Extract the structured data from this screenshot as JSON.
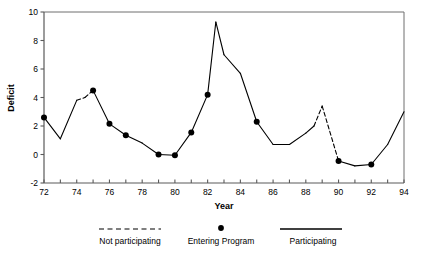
{
  "chart_data": {
    "type": "line",
    "title": "",
    "xlabel": "Year",
    "ylabel": "Deficit",
    "xlim": [
      72,
      94
    ],
    "ylim": [
      -2,
      10
    ],
    "xticks": [
      72,
      73,
      74,
      75,
      76,
      77,
      78,
      79,
      80,
      81,
      82,
      83,
      84,
      85,
      86,
      87,
      88,
      89,
      90,
      91,
      92,
      93,
      94
    ],
    "xtick_labels": [
      "72",
      "",
      "74",
      "",
      "76",
      "",
      "78",
      "",
      "80",
      "",
      "82",
      "",
      "84",
      "",
      "86",
      "",
      "88",
      "",
      "90",
      "",
      "92",
      "",
      "94"
    ],
    "yticks": [
      -2,
      0,
      2,
      4,
      6,
      8,
      10
    ],
    "ytick_labels": [
      "-2",
      "0",
      "2",
      "4",
      "6",
      "8",
      "10"
    ],
    "grid": false,
    "legend_position": "below-axes",
    "x": [
      72,
      73,
      74,
      74.5,
      75,
      76,
      77,
      78,
      79,
      80,
      81,
      82,
      82.5,
      83,
      84,
      85,
      86,
      87,
      88,
      88.5,
      89,
      90,
      91,
      92,
      93,
      94
    ],
    "values": [
      2.6,
      1.1,
      3.8,
      4.0,
      4.5,
      2.15,
      1.35,
      0.8,
      0.0,
      -0.05,
      1.55,
      4.2,
      9.3,
      7.0,
      5.7,
      2.3,
      0.7,
      0.7,
      1.5,
      2.0,
      3.4,
      -0.45,
      -0.8,
      -0.7,
      0.7,
      3.0
    ],
    "dashed_segments": [
      [
        74,
        75
      ],
      [
        88.5,
        90
      ]
    ],
    "marker_points": [
      {
        "x": 72,
        "y": 2.6
      },
      {
        "x": 75,
        "y": 4.5
      },
      {
        "x": 76,
        "y": 2.15
      },
      {
        "x": 77,
        "y": 1.35
      },
      {
        "x": 79,
        "y": 0.0
      },
      {
        "x": 80,
        "y": -0.05
      },
      {
        "x": 81,
        "y": 1.55
      },
      {
        "x": 82,
        "y": 4.2
      },
      {
        "x": 85,
        "y": 2.3
      },
      {
        "x": 90,
        "y": -0.45
      },
      {
        "x": 92,
        "y": -0.7
      }
    ],
    "series_color": "#000000",
    "legend": [
      {
        "key": "not-participating",
        "label": "Not participating",
        "style": "dashed"
      },
      {
        "key": "entering-program",
        "label": "Entering Program",
        "style": "marker"
      },
      {
        "key": "participating",
        "label": "Participating",
        "style": "solid"
      }
    ]
  }
}
